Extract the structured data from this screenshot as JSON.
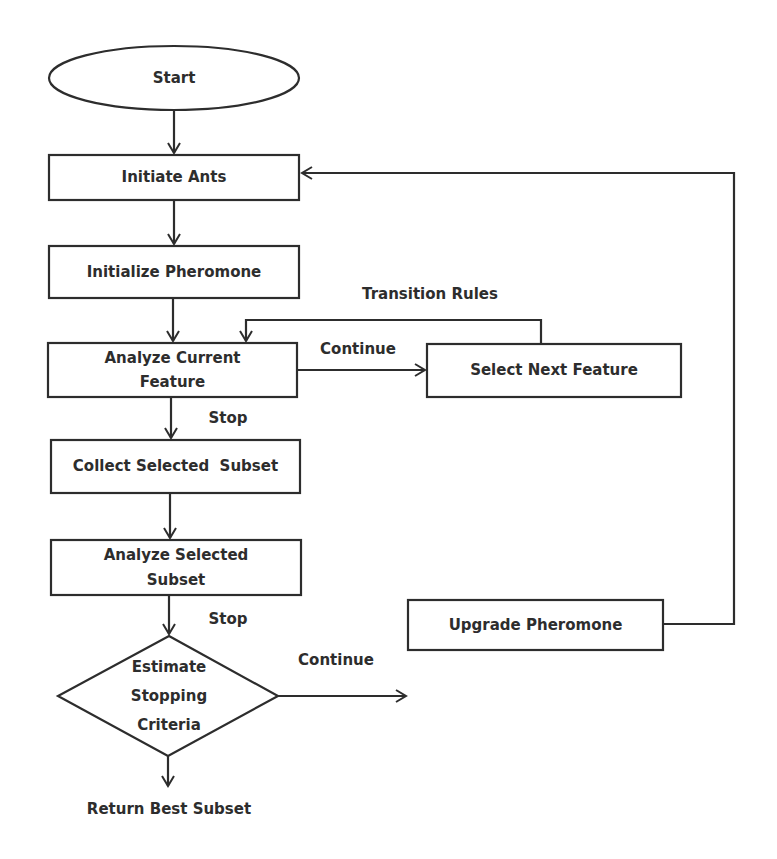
{
  "diagram": {
    "type": "flowchart",
    "stroke_color": "#2d2d2d",
    "background": "#ffffff",
    "nodes": {
      "start": {
        "label": "Start",
        "shape": "ellipse"
      },
      "initiate_ants": {
        "label": "Initiate Ants",
        "shape": "rect"
      },
      "initialize_pheromone": {
        "label": "Initialize Pheromone",
        "shape": "rect"
      },
      "analyze_current_feature": {
        "line1": "Analyze Current",
        "line2": "Feature",
        "shape": "rect"
      },
      "select_next_feature": {
        "label": "Select Next Feature",
        "shape": "rect"
      },
      "collect_selected_subset": {
        "label": "Collect Selected  Subset",
        "shape": "rect"
      },
      "analyze_selected_subset": {
        "line1": "Analyze Selected",
        "line2": "Subset",
        "shape": "rect"
      },
      "estimate_stopping_criteria": {
        "line1": "Estimate",
        "line2": "Stopping",
        "line3": "Criteria",
        "shape": "diamond"
      },
      "upgrade_pheromone": {
        "label": "Upgrade Pheromone",
        "shape": "rect"
      },
      "return_best_subset": {
        "label": "Return Best Subset",
        "shape": "text"
      }
    },
    "edge_labels": {
      "transition_rules": "Transition Rules",
      "continue_feature": "Continue",
      "stop_feature": "Stop",
      "stop_subset": "Stop",
      "continue_criteria": "Continue"
    },
    "edges": [
      {
        "from": "start",
        "to": "initiate_ants"
      },
      {
        "from": "initiate_ants",
        "to": "initialize_pheromone"
      },
      {
        "from": "initialize_pheromone",
        "to": "analyze_current_feature"
      },
      {
        "from": "analyze_current_feature",
        "to": "select_next_feature",
        "label": "Continue"
      },
      {
        "from": "select_next_feature",
        "to": "analyze_current_feature",
        "label": "Transition Rules"
      },
      {
        "from": "analyze_current_feature",
        "to": "collect_selected_subset",
        "label": "Stop"
      },
      {
        "from": "collect_selected_subset",
        "to": "analyze_selected_subset"
      },
      {
        "from": "analyze_selected_subset",
        "to": "estimate_stopping_criteria",
        "label": "Stop"
      },
      {
        "from": "estimate_stopping_criteria",
        "to": "upgrade_pheromone",
        "label": "Continue"
      },
      {
        "from": "upgrade_pheromone",
        "to": "initiate_ants"
      },
      {
        "from": "estimate_stopping_criteria",
        "to": "return_best_subset"
      }
    ]
  }
}
